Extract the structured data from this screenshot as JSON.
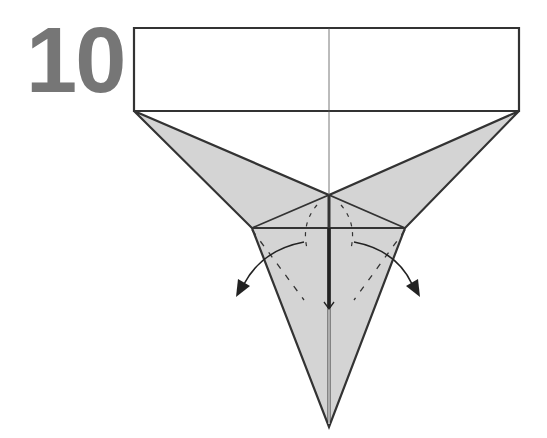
{
  "diagram": {
    "step_number": "10",
    "type": "origami-fold-diagram",
    "colors": {
      "paper_back": "#ffffff",
      "paper_front": "#d4d4d4",
      "line": "#333333",
      "step_number": "#767676"
    },
    "annotations": [
      {
        "kind": "valley-fold-dashed",
        "side": "left"
      },
      {
        "kind": "valley-fold-dashed",
        "side": "right"
      },
      {
        "kind": "curved-arrow",
        "direction": "down-left"
      },
      {
        "kind": "curved-arrow",
        "direction": "down-right"
      },
      {
        "kind": "center-arrow",
        "direction": "down"
      }
    ]
  }
}
